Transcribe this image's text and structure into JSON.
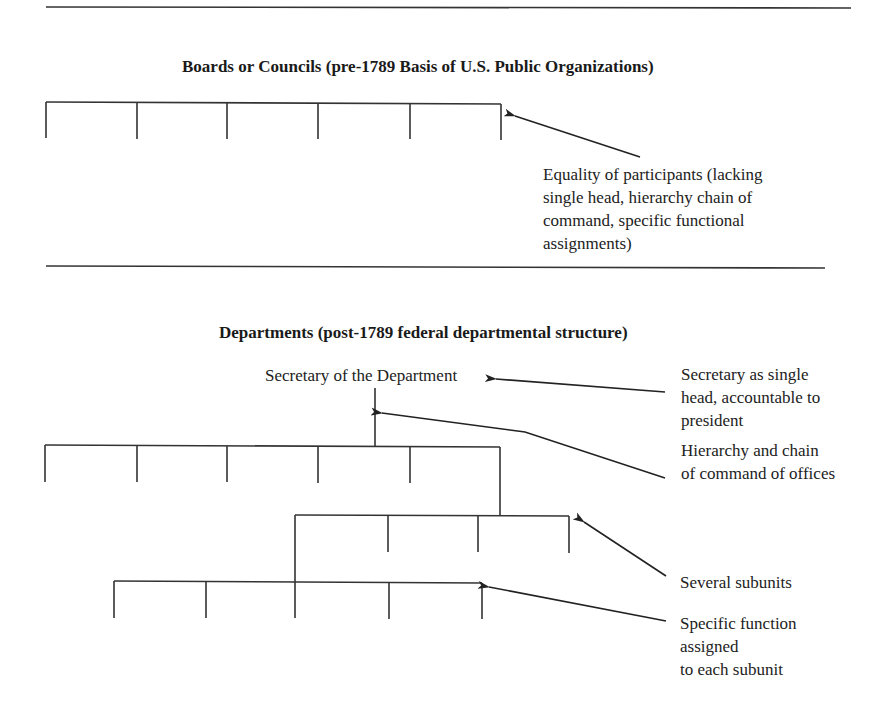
{
  "sections": {
    "boards": {
      "title": "Boards or Councils (pre-1789 Basis of U.S. Public Organizations)",
      "annotation": {
        "lines": [
          "Equality of participants (lacking",
          "single head, hierarchy chain of",
          "command, specific functional",
          "assignments)"
        ]
      }
    },
    "departments": {
      "title": "Departments (post-1789 federal departmental structure)",
      "head_label": "Secretary of the Department",
      "annotations": {
        "secretary": {
          "lines": [
            "Secretary as single",
            "head, accountable to",
            "president"
          ]
        },
        "hierarchy": {
          "lines": [
            "Hierarchy and chain",
            "of command of offices"
          ]
        },
        "subunits": {
          "lines": [
            "Several subunits"
          ]
        },
        "function": {
          "lines": [
            "Specific function",
            "assigned",
            "to each subunit"
          ]
        }
      }
    }
  },
  "colors": {
    "line": "#333333",
    "text": "#222222",
    "background": "#ffffff"
  }
}
